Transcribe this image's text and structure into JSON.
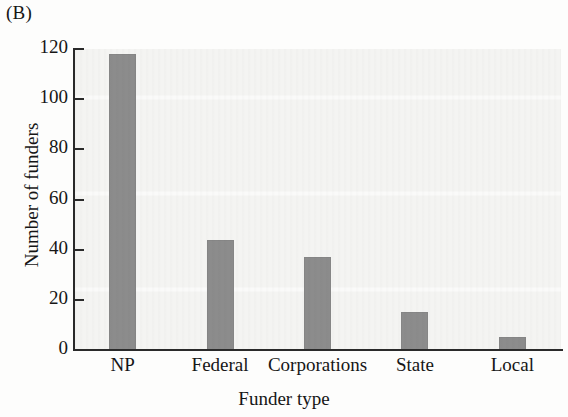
{
  "panel": {
    "label": "(B)"
  },
  "chart_data": {
    "type": "bar",
    "title": "",
    "subtitle": "",
    "panel_label": "(B)",
    "categories": [
      "NP",
      "Federal",
      "Corporations",
      "State",
      "Local"
    ],
    "values": [
      118,
      44,
      37,
      15,
      5
    ],
    "series": [
      {
        "name": "Number of funders",
        "values": [
          118,
          44,
          37,
          15,
          5
        ]
      }
    ],
    "xlabel": "Funder type",
    "ylabel": "Number of funders",
    "ylim": [
      0,
      120
    ],
    "yticks": [
      0,
      20,
      40,
      60,
      80,
      100,
      120
    ],
    "ytick_labels": [
      "0",
      "20",
      "40",
      "60",
      "80",
      "100",
      "120"
    ],
    "xtick_labels": [
      "NP",
      "Federal",
      "Corporations",
      "State",
      "Local"
    ],
    "grid": false,
    "legend": null,
    "legend_position": "none",
    "bar_color": "#8c8c8c",
    "axis_color": "#2a2a2a",
    "plot_background": "#f4f4f2",
    "figure_background": "#fdfdfc",
    "annotations": []
  },
  "axes": {
    "x_title": "Funder type",
    "y_title": "Number of funders"
  }
}
